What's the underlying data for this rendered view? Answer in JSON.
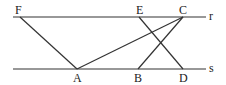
{
  "diagram": {
    "lines": {
      "r": {
        "label": "r",
        "y": 17,
        "x1": 13,
        "x2": 206
      },
      "s": {
        "label": "s",
        "y": 69,
        "x1": 13,
        "x2": 206
      }
    },
    "points": {
      "F": {
        "label": "F",
        "x": 20,
        "y": 17
      },
      "E": {
        "label": "E",
        "x": 139,
        "y": 17
      },
      "C": {
        "label": "C",
        "x": 183,
        "y": 17
      },
      "A": {
        "label": "A",
        "x": 77,
        "y": 69
      },
      "B": {
        "label": "B",
        "x": 138,
        "y": 69
      },
      "D": {
        "label": "D",
        "x": 183,
        "y": 69
      }
    },
    "segments": [
      [
        "F",
        "A"
      ],
      [
        "A",
        "C"
      ],
      [
        "C",
        "B"
      ],
      [
        "E",
        "D"
      ]
    ],
    "stroke_color": "#333333"
  }
}
